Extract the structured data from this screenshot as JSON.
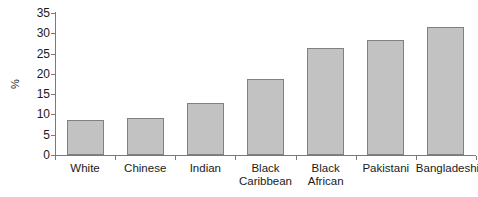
{
  "chart_data": {
    "type": "bar",
    "title": "",
    "subtitle": "",
    "xlabel": "",
    "ylabel": "%",
    "categories": [
      "White",
      "Chinese",
      "Indian",
      "Black\nCaribbean",
      "Black\nAfrican",
      "Pakistani",
      "Bangladeshi"
    ],
    "values": [
      8.7,
      9.2,
      12.8,
      18.7,
      26.3,
      28.4,
      31.6
    ],
    "ylim": [
      0,
      35
    ],
    "yticks": [
      0,
      5,
      10,
      15,
      20,
      25,
      30,
      35
    ],
    "ytick_labels": [
      "0",
      "5",
      "10",
      "15",
      "20",
      "25",
      "30",
      "35"
    ],
    "grid": false,
    "legend": null,
    "bar_color": "#c2c2c2",
    "bar_border_color": "#808080",
    "axis_color": "#7a7a7a",
    "background": "#ffffff"
  }
}
